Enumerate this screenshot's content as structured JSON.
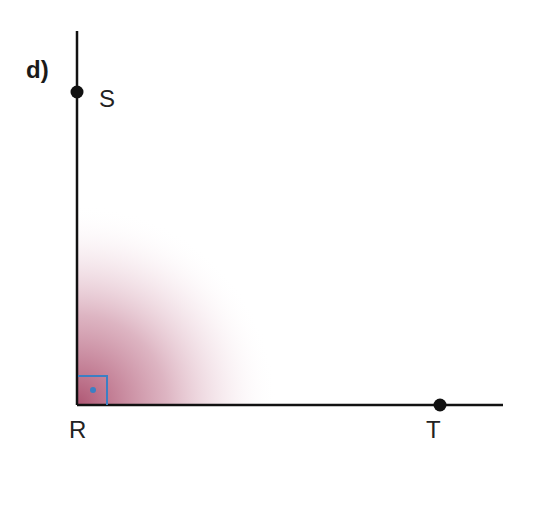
{
  "diagram": {
    "part_label": "d)",
    "points": [
      {
        "name": "S",
        "label": "S"
      },
      {
        "name": "R",
        "label": "R"
      },
      {
        "name": "T",
        "label": "T"
      }
    ],
    "angle": {
      "vertex": "R",
      "type": "right-angle",
      "marker_color": "#3b7fc4"
    },
    "shading_color": "#a0385a",
    "axis_color": "#111111"
  }
}
